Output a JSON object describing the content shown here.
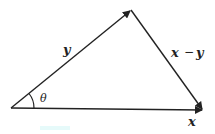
{
  "diagram": {
    "type": "vector-triangle",
    "vertices": {
      "origin": {
        "x": 11,
        "y": 108
      },
      "apex": {
        "x": 131,
        "y": 10
      },
      "right": {
        "x": 203,
        "y": 110
      }
    },
    "vectors": [
      {
        "name": "y",
        "label": "y",
        "from": "origin",
        "to": "apex"
      },
      {
        "name": "x",
        "label": "x",
        "from": "origin",
        "to": "right"
      },
      {
        "name": "x-y",
        "label": "x − y",
        "from": "apex",
        "to": "right"
      }
    ],
    "angle": {
      "label": "θ",
      "at": "origin",
      "between": [
        "x",
        "y"
      ]
    },
    "labels": {
      "y": "y",
      "x": "x",
      "x_minus_y_x": "x",
      "x_minus_y_op": "−",
      "x_minus_y_y": "y",
      "theta": "θ"
    },
    "colors": {
      "line": "#222222",
      "background": "#ffffff",
      "highlight": "#e6fafa"
    }
  }
}
